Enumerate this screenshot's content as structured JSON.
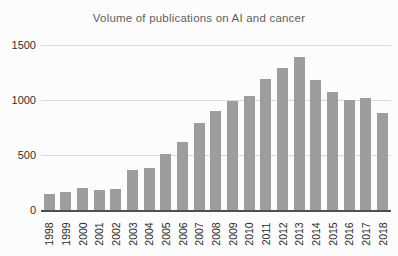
{
  "title": "Volume of publications on AI and cancer",
  "colors": {
    "bar": "#9d9d9d",
    "gridline": "#dadada",
    "axis_line": "#4f4f4f",
    "title_text": "#5f5f5f",
    "tick_text": "#2b2b2b",
    "background": "#fcfcfc"
  },
  "chart_data": {
    "type": "bar",
    "title": "Volume of publications on AI and cancer",
    "categories": [
      "1998",
      "1999",
      "2000",
      "2001",
      "2002",
      "2003",
      "2004",
      "2005",
      "2006",
      "2007",
      "2008",
      "2009",
      "2010",
      "2011",
      "2012",
      "2013",
      "2014",
      "2015",
      "2016",
      "2017",
      "2018"
    ],
    "values": [
      145,
      160,
      200,
      185,
      195,
      365,
      380,
      510,
      615,
      790,
      900,
      990,
      1040,
      1190,
      1290,
      1390,
      1180,
      1070,
      1000,
      1020,
      880
    ],
    "xlabel": "",
    "ylabel": "",
    "ylim": [
      0,
      1500
    ],
    "yticks": [
      0,
      500,
      1000,
      1500
    ],
    "grid": true,
    "legend": "none",
    "x_tick_rotation": -90,
    "bar_color": "#9d9d9d"
  }
}
